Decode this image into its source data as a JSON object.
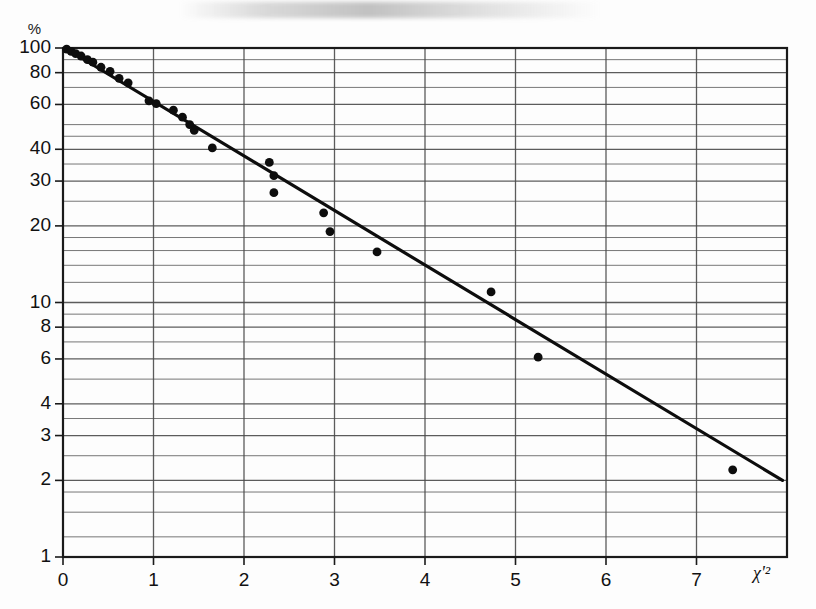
{
  "figure": {
    "background_color": "#fdfdfd",
    "frame_color": "#1a1a1a",
    "grid_color": "#4a4a4a",
    "point_color": "#0d0d0d",
    "line_color": "#0d0d0d"
  },
  "axes": {
    "y_unit_label": "%",
    "x_axis_title": "χ'²",
    "y_tick_labels": [
      "100",
      "80",
      "60",
      "40",
      "30",
      "20",
      "10",
      "8",
      "6",
      "4",
      "3",
      "2",
      "1"
    ],
    "x_tick_labels": [
      "0",
      "1",
      "2",
      "3",
      "4",
      "5",
      "6",
      "7"
    ]
  },
  "chart_data": {
    "type": "scatter",
    "title": "",
    "subtitle": "",
    "xlabel": "χ'²",
    "ylabel": "%",
    "yscale": "log",
    "xscale": "linear",
    "xlim": [
      0,
      8
    ],
    "ylim": [
      1,
      100
    ],
    "grid": true,
    "legend": null,
    "x_ticks": [
      0,
      1,
      2,
      3,
      4,
      5,
      6,
      7
    ],
    "y_ticks": [
      100,
      80,
      60,
      40,
      30,
      20,
      10,
      8,
      6,
      4,
      3,
      2,
      1
    ],
    "y_gridlines_minor": [
      90,
      70,
      50,
      45,
      35,
      25,
      18,
      16,
      14,
      12,
      9,
      7,
      5,
      3.5,
      2.5,
      1.8,
      1.5,
      1.2
    ],
    "series": [
      {
        "name": "observed",
        "type": "scatter",
        "points": [
          {
            "x": 0.04,
            "y": 99.0
          },
          {
            "x": 0.09,
            "y": 97.0
          },
          {
            "x": 0.14,
            "y": 95.0
          },
          {
            "x": 0.2,
            "y": 93.0
          },
          {
            "x": 0.27,
            "y": 90.0
          },
          {
            "x": 0.33,
            "y": 88.0
          },
          {
            "x": 0.42,
            "y": 84.0
          },
          {
            "x": 0.52,
            "y": 81.0
          },
          {
            "x": 0.62,
            "y": 76.0
          },
          {
            "x": 0.72,
            "y": 73.0
          },
          {
            "x": 0.95,
            "y": 62.0
          },
          {
            "x": 1.03,
            "y": 60.5
          },
          {
            "x": 1.22,
            "y": 57.0
          },
          {
            "x": 1.32,
            "y": 53.5
          },
          {
            "x": 1.4,
            "y": 50.0
          },
          {
            "x": 1.45,
            "y": 47.5
          },
          {
            "x": 1.65,
            "y": 40.5
          },
          {
            "x": 2.28,
            "y": 35.5
          },
          {
            "x": 2.33,
            "y": 31.5
          },
          {
            "x": 2.33,
            "y": 27.0
          },
          {
            "x": 2.88,
            "y": 22.5
          },
          {
            "x": 2.95,
            "y": 19.0
          },
          {
            "x": 3.47,
            "y": 15.8
          },
          {
            "x": 4.73,
            "y": 11.0
          },
          {
            "x": 5.25,
            "y": 6.1
          },
          {
            "x": 7.4,
            "y": 2.2
          }
        ]
      },
      {
        "name": "fitted-line",
        "type": "line",
        "points": [
          {
            "x": 0.02,
            "y": 100.0
          },
          {
            "x": 7.95,
            "y": 2.0
          }
        ]
      }
    ]
  }
}
